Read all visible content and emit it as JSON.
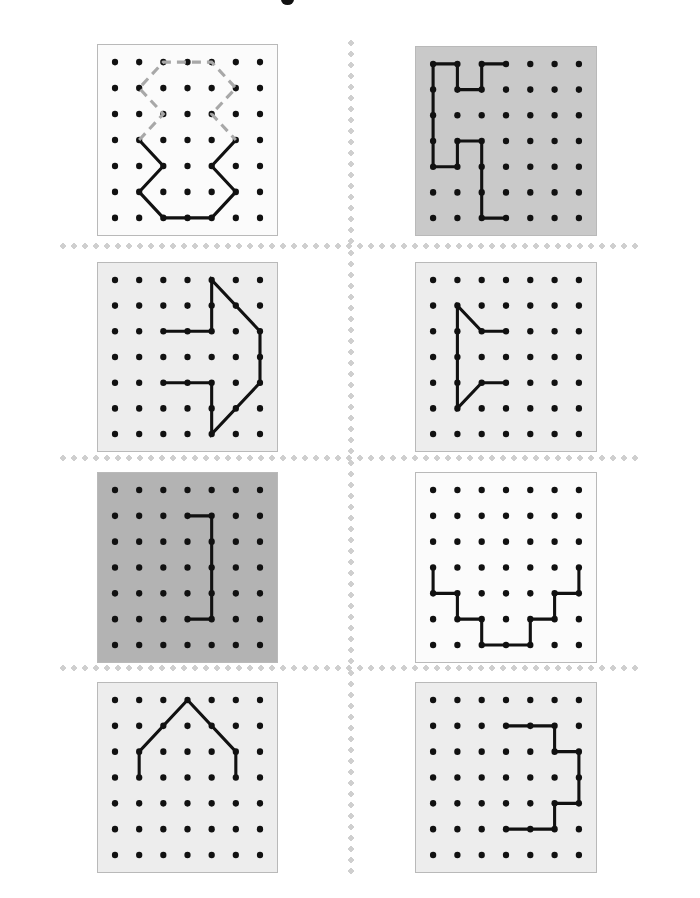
{
  "page": {
    "width": 700,
    "height": 898,
    "background_color": "#ffffff",
    "top_mark_label": "page-top-mark"
  },
  "dividers": {
    "color": "#cfcfcf",
    "style": "dotted",
    "horizontal_rows": [
      243,
      455,
      665
    ],
    "vertical_x": 348
  },
  "grid": {
    "columns": 7,
    "rows": 7,
    "peg_color": "#111111",
    "peg_radius": 3.1,
    "border_color": "#b9b9b9"
  },
  "panels": [
    {
      "id": "panel-1",
      "position": "row1-left",
      "x": 97,
      "y": 44,
      "width": 181,
      "height": 192,
      "background_color": "#fbfbfb",
      "paths": [
        {
          "name": "solid-lower-shape",
          "style": "solid",
          "color": "#111111",
          "points": [
            [
              1,
              3
            ],
            [
              2,
              4
            ],
            [
              1,
              5
            ],
            [
              2,
              6
            ],
            [
              4,
              6
            ],
            [
              5,
              5
            ],
            [
              4,
              4
            ],
            [
              5,
              3
            ]
          ]
        },
        {
          "name": "dashed-upper-shape",
          "style": "dashed",
          "color": "#a8a8a8",
          "points": [
            [
              1,
              3
            ],
            [
              2,
              2
            ],
            [
              1,
              1
            ],
            [
              2,
              0
            ],
            [
              4,
              0
            ],
            [
              5,
              1
            ],
            [
              4,
              2
            ],
            [
              5,
              3
            ]
          ]
        }
      ]
    },
    {
      "id": "panel-2",
      "position": "row1-right",
      "x": 415,
      "y": 46,
      "width": 182,
      "height": 190,
      "background_color": "#c9c9c9",
      "paths": [
        {
          "name": "solid-zigzag-shape",
          "style": "solid",
          "color": "#111111",
          "points": [
            [
              3,
              0
            ],
            [
              2,
              0
            ],
            [
              2,
              1
            ],
            [
              1,
              1
            ],
            [
              1,
              0
            ],
            [
              0,
              0
            ],
            [
              0,
              4
            ],
            [
              1,
              4
            ],
            [
              1,
              3
            ],
            [
              2,
              3
            ],
            [
              2,
              6
            ],
            [
              3,
              6
            ]
          ]
        }
      ]
    },
    {
      "id": "panel-3",
      "position": "row2-left",
      "x": 97,
      "y": 262,
      "width": 181,
      "height": 190,
      "background_color": "#ededed",
      "paths": [
        {
          "name": "solid-arrow-right",
          "style": "solid",
          "color": "#111111",
          "points": [
            [
              2,
              2
            ],
            [
              4,
              2
            ],
            [
              4,
              0
            ],
            [
              6,
              2
            ],
            [
              6,
              4
            ],
            [
              4,
              6
            ],
            [
              4,
              4
            ],
            [
              2,
              4
            ]
          ]
        }
      ]
    },
    {
      "id": "panel-4",
      "position": "row2-right",
      "x": 415,
      "y": 262,
      "width": 182,
      "height": 190,
      "background_color": "#ededed",
      "paths": [
        {
          "name": "solid-arrow-left",
          "style": "solid",
          "color": "#111111",
          "points": [
            [
              3,
              2
            ],
            [
              2,
              2
            ],
            [
              1,
              1
            ],
            [
              1,
              5
            ],
            [
              2,
              4
            ],
            [
              3,
              4
            ]
          ]
        }
      ]
    },
    {
      "id": "panel-5",
      "position": "row3-left",
      "x": 97,
      "y": 472,
      "width": 181,
      "height": 191,
      "background_color": "#b3b3b3",
      "paths": [
        {
          "name": "solid-bracket",
          "style": "solid",
          "color": "#111111",
          "points": [
            [
              3,
              1
            ],
            [
              4,
              1
            ],
            [
              4,
              5
            ],
            [
              3,
              5
            ]
          ]
        }
      ]
    },
    {
      "id": "panel-6",
      "position": "row3-right",
      "x": 415,
      "y": 472,
      "width": 182,
      "height": 191,
      "background_color": "#fbfbfb",
      "paths": [
        {
          "name": "solid-valley-stairs",
          "style": "solid",
          "color": "#111111",
          "points": [
            [
              0,
              3
            ],
            [
              0,
              4
            ],
            [
              1,
              4
            ],
            [
              1,
              5
            ],
            [
              2,
              5
            ],
            [
              2,
              6
            ],
            [
              4,
              6
            ],
            [
              4,
              5
            ],
            [
              5,
              5
            ],
            [
              5,
              4
            ],
            [
              6,
              4
            ],
            [
              6,
              3
            ]
          ]
        }
      ]
    },
    {
      "id": "panel-7",
      "position": "row4-left",
      "x": 97,
      "y": 682,
      "width": 181,
      "height": 191,
      "background_color": "#ededed",
      "paths": [
        {
          "name": "solid-roof-house",
          "style": "solid",
          "color": "#111111",
          "points": [
            [
              1,
              3
            ],
            [
              1,
              2
            ],
            [
              3,
              0
            ],
            [
              5,
              2
            ],
            [
              5,
              3
            ]
          ]
        }
      ]
    },
    {
      "id": "panel-8",
      "position": "row4-right",
      "x": 415,
      "y": 682,
      "width": 182,
      "height": 191,
      "background_color": "#ededed",
      "paths": [
        {
          "name": "solid-notched-block",
          "style": "solid",
          "color": "#111111",
          "points": [
            [
              3,
              1
            ],
            [
              5,
              1
            ],
            [
              5,
              2
            ],
            [
              6,
              2
            ],
            [
              6,
              4
            ],
            [
              5,
              4
            ],
            [
              5,
              5
            ],
            [
              3,
              5
            ]
          ]
        }
      ]
    }
  ]
}
